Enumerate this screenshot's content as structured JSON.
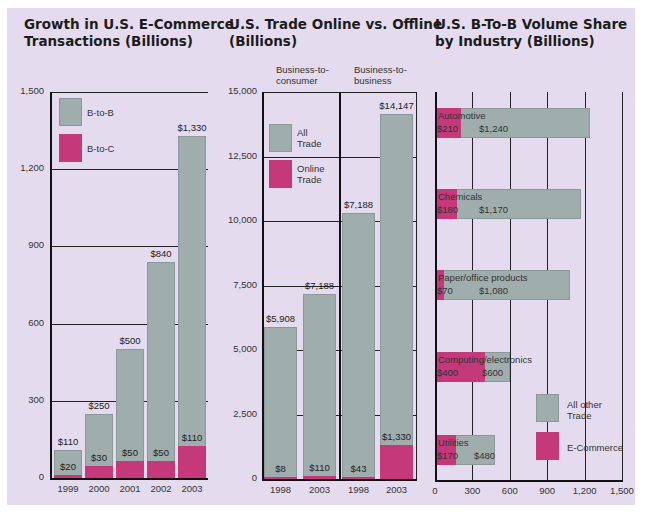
{
  "colors": {
    "background": "#e4dcee",
    "gray_bar": "#9fadac",
    "pink_bar": "#c53879"
  },
  "chart_data": [
    {
      "type": "bar",
      "stacked": false,
      "title": "Growth in U.S. E-Commerce Transactions (Billions)",
      "title_lines": [
        "Growth in U.S. E-Commerce",
        "Transactions (Billions)"
      ],
      "categories": [
        "1999",
        "2000",
        "2001",
        "2002",
        "2003"
      ],
      "series": [
        {
          "name": "B-to-B",
          "values": [
            110,
            250,
            500,
            840,
            1330
          ],
          "labels": [
            "$110",
            "$250",
            "$500",
            "$840",
            "$1,330"
          ]
        },
        {
          "name": "B-to-C",
          "values": [
            20,
            30,
            50,
            50,
            110
          ],
          "labels": [
            "$20",
            "$30",
            "$50",
            "$50",
            "$110"
          ]
        }
      ],
      "yticks": [
        "0",
        "300",
        "600",
        "900",
        "1,200",
        "1,500"
      ],
      "ylim": [
        0,
        1500
      ],
      "grid": true,
      "legend": [
        "B-to-B",
        "B-to-C"
      ],
      "legend_position": "upper-left"
    },
    {
      "type": "bar",
      "title": "U.S. Trade Online vs. Offline (Billions)",
      "title_lines": [
        "U.S. Trade Online vs. Offline",
        "(Billions)"
      ],
      "groups": [
        {
          "name_lines": [
            "Business-to-",
            "consumer"
          ],
          "categories": [
            "1998",
            "2003"
          ]
        },
        {
          "name_lines": [
            "Business-to-",
            "business"
          ],
          "categories": [
            "1998",
            "2003"
          ]
        }
      ],
      "categories": [
        "1998",
        "2003",
        "1998",
        "2003"
      ],
      "series": [
        {
          "name": "All Trade",
          "values": [
            5908,
            7188,
            10300,
            14147
          ],
          "labels": [
            "$5,908",
            "$7,188",
            "$7,188",
            "$14,147"
          ]
        },
        {
          "name": "Online Trade",
          "values": [
            8,
            110,
            43,
            1330
          ],
          "labels": [
            "$8",
            "$110",
            "$43",
            "$1,330"
          ]
        }
      ],
      "yticks": [
        "0",
        "2,500",
        "5,000",
        "7,500",
        "10,000",
        "12,500",
        "15,000"
      ],
      "ylim": [
        0,
        15000
      ],
      "grid": true,
      "legend": [
        "All Trade",
        "Online Trade"
      ],
      "legend_position": "upper-left"
    },
    {
      "type": "bar",
      "orientation": "horizontal",
      "title": "U.S. B-To-B Volume Share by Industry (Billions)",
      "title_lines": [
        "U.S. B-To-B Volume Share",
        "by Industry (Billions)"
      ],
      "categories": [
        "Automotive",
        "Chemicals",
        "Paper/office products",
        "Computing/electronics",
        "Utilities"
      ],
      "series": [
        {
          "name": "E-Commerce",
          "values": [
            210,
            180,
            70,
            400,
            170
          ],
          "labels": [
            "$210",
            "$180",
            "$70",
            "$400",
            "$170"
          ]
        },
        {
          "name": "All other Trade",
          "values": [
            1240,
            1170,
            1080,
            600,
            480
          ],
          "labels": [
            "$1,240",
            "$1,170",
            "$1,080",
            "$600",
            "$480"
          ]
        }
      ],
      "xticks": [
        "0",
        "300",
        "600",
        "900",
        "1,200",
        "1,500"
      ],
      "xlim": [
        0,
        1500
      ],
      "grid": true,
      "legend": [
        "All other Trade",
        "E-Commerce"
      ],
      "legend_lines": [
        [
          "All other",
          "Trade"
        ],
        [
          "E-Commerce"
        ]
      ],
      "legend_position": "lower-right"
    }
  ]
}
